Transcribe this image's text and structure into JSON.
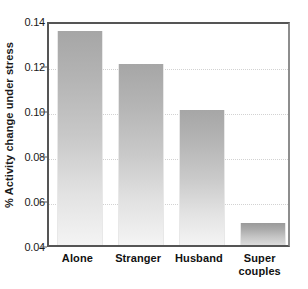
{
  "chart_data": {
    "type": "bar",
    "title": "",
    "xlabel": "",
    "ylabel": "% Activity change under stress",
    "categories": [
      "Alone",
      "Stranger",
      "Husband",
      "Super couples"
    ],
    "category_lines": [
      [
        "Alone"
      ],
      [
        "Stranger"
      ],
      [
        "Husband"
      ],
      [
        "Super",
        "couples"
      ]
    ],
    "values": [
      0.135,
      0.1205,
      0.1,
      0.05
    ],
    "ylim": [
      0.04,
      0.14
    ],
    "yticks": [
      0.04,
      0.06,
      0.08,
      0.1,
      0.12,
      0.14
    ],
    "ytick_labels": [
      "0.04",
      "0.06",
      "0.08",
      "0.10",
      "0.12",
      "0.14"
    ],
    "grid": true,
    "grid_axis": "y",
    "legend": false,
    "legend_position": "none",
    "bar_color_top": "#a6a6a6",
    "bar_color_bottom": "#f4f4f4",
    "axis_color": "#555555",
    "grid_color": "#d2d2d2",
    "background": "#ffffff"
  }
}
